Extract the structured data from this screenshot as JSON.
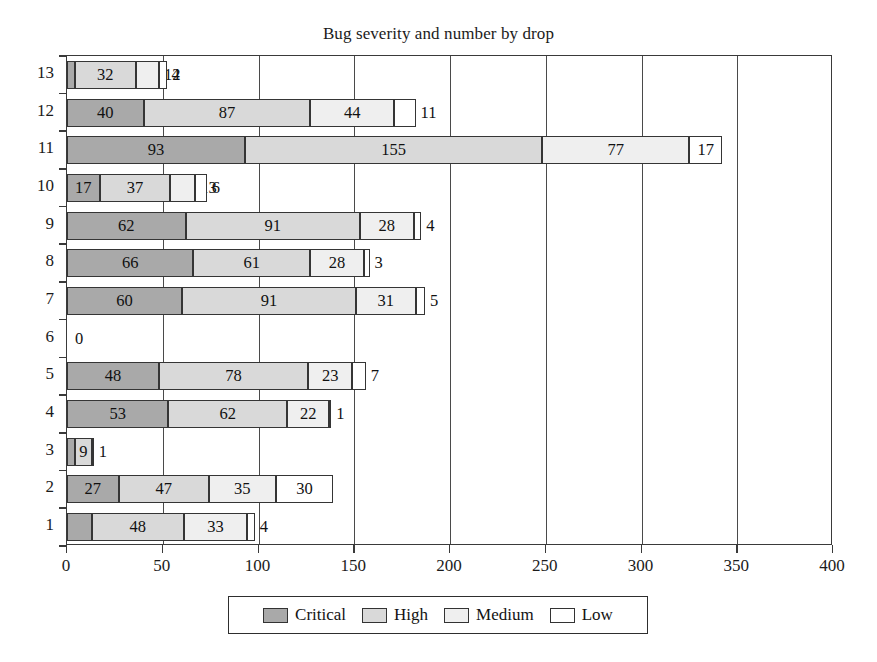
{
  "chart_data": {
    "type": "bar",
    "orientation": "horizontal",
    "stacked": true,
    "title": "Bug severity and number by drop",
    "xlabel": "",
    "ylabel": "",
    "xlim": [
      0,
      400
    ],
    "ylim": [
      1,
      13
    ],
    "grid": true,
    "xticks": [
      0,
      50,
      100,
      150,
      200,
      250,
      300,
      350,
      400
    ],
    "categories": [
      "13",
      "12",
      "11",
      "10",
      "9",
      "8",
      "7",
      "6",
      "5",
      "4",
      "3",
      "2",
      "1"
    ],
    "legend_position": "bottom-center",
    "series": [
      {
        "name": "Critical",
        "color": "#a9a9a9",
        "values": [
          4,
          40,
          93,
          17,
          62,
          66,
          60,
          0,
          48,
          53,
          4,
          27,
          13
        ]
      },
      {
        "name": "High",
        "color": "#d9d9d9",
        "values": [
          32,
          87,
          155,
          37,
          91,
          61,
          91,
          0,
          78,
          62,
          9,
          47,
          48
        ]
      },
      {
        "name": "Medium",
        "color": "#efefef",
        "values": [
          12,
          44,
          77,
          13,
          28,
          28,
          31,
          0,
          23,
          22,
          0,
          35,
          33
        ]
      },
      {
        "name": "Low",
        "color": "#ffffff",
        "values": [
          4,
          11,
          17,
          6,
          4,
          3,
          5,
          0,
          7,
          1,
          1,
          30,
          4
        ]
      }
    ],
    "totals": [
      52,
      182,
      342,
      73,
      185,
      158,
      187,
      0,
      156,
      138,
      14,
      139,
      98
    ],
    "zero_rows": [
      "6"
    ],
    "zero_label": "0"
  },
  "legend": {
    "items": [
      {
        "label": "Critical",
        "swatch": "critical"
      },
      {
        "label": "High",
        "swatch": "high"
      },
      {
        "label": "Medium",
        "swatch": "medium"
      },
      {
        "label": "Low",
        "swatch": "low"
      }
    ]
  },
  "axis": {
    "x_tick_labels": [
      "0",
      "50",
      "100",
      "150",
      "200",
      "250",
      "300",
      "350",
      "400"
    ],
    "y_tick_labels": [
      "13",
      "12",
      "11",
      "10",
      "9",
      "8",
      "7",
      "6",
      "5",
      "4",
      "3",
      "2",
      "1"
    ]
  },
  "colors": {
    "critical": "#a9a9a9",
    "high": "#d9d9d9",
    "medium": "#efefef",
    "low": "#ffffff",
    "frame": "#3a3a3a",
    "text": "#1b1b1b"
  }
}
